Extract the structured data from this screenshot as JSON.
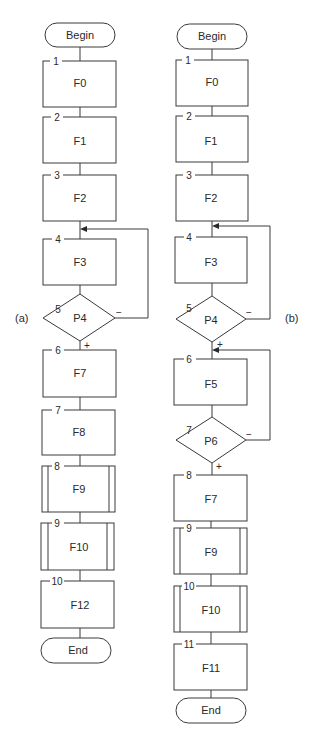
{
  "diagram": {
    "type": "flowchart",
    "panels": [
      {
        "caption": "(a)",
        "start": "Begin",
        "end": "End",
        "nodes": [
          {
            "num": "1",
            "label": "F0",
            "kind": "process"
          },
          {
            "num": "2",
            "label": "F1",
            "kind": "process"
          },
          {
            "num": "3",
            "label": "F2",
            "kind": "process"
          },
          {
            "num": "4",
            "label": "F3",
            "kind": "process"
          },
          {
            "num": "5",
            "label": "P4",
            "kind": "decision",
            "yes": "+",
            "no": "−"
          },
          {
            "num": "6",
            "label": "F7",
            "kind": "process"
          },
          {
            "num": "7",
            "label": "F8",
            "kind": "process"
          },
          {
            "num": "8",
            "label": "F9",
            "kind": "predefined"
          },
          {
            "num": "9",
            "label": "F10",
            "kind": "predefined"
          },
          {
            "num": "10",
            "label": "F12",
            "kind": "process"
          }
        ],
        "loops": [
          {
            "from": "P4",
            "to": "F3",
            "branch": "−"
          }
        ]
      },
      {
        "caption": "(b)",
        "start": "Begin",
        "end": "End",
        "nodes": [
          {
            "num": "1",
            "label": "F0",
            "kind": "process"
          },
          {
            "num": "2",
            "label": "F1",
            "kind": "process"
          },
          {
            "num": "3",
            "label": "F2",
            "kind": "process"
          },
          {
            "num": "4",
            "label": "F3",
            "kind": "process"
          },
          {
            "num": "5",
            "label": "P4",
            "kind": "decision",
            "yes": "+",
            "no": "−"
          },
          {
            "num": "6",
            "label": "F5",
            "kind": "process"
          },
          {
            "num": "7",
            "label": "P6",
            "kind": "decision",
            "yes": "+",
            "no": "−"
          },
          {
            "num": "8",
            "label": "F7",
            "kind": "process"
          },
          {
            "num": "9",
            "label": "F9",
            "kind": "predefined"
          },
          {
            "num": "10",
            "label": "F10",
            "kind": "predefined"
          },
          {
            "num": "11",
            "label": "F11",
            "kind": "process"
          }
        ],
        "loops": [
          {
            "from": "P4",
            "to": "F3",
            "branch": "−"
          },
          {
            "from": "P6",
            "to": "F5",
            "branch": "−"
          }
        ]
      }
    ]
  }
}
